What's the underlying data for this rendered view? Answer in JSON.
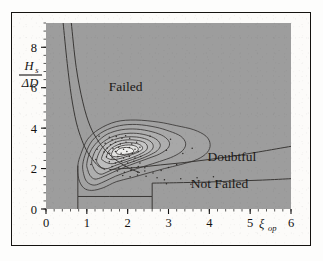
{
  "figure": {
    "kind": "contour-scatter-plot",
    "background_color": "#fcfbf9",
    "plot_fill_color": "#9d9d9d",
    "border_color": "#14120f",
    "line_color": "#3a3836"
  },
  "chart_data": {
    "type": "line",
    "title": "",
    "subtitle": "",
    "xlabel": "ξ_op",
    "ylabel": "H_s / ΔD",
    "xlim": [
      0,
      6
    ],
    "ylim": [
      0,
      9.2
    ],
    "grid": false,
    "legend_position": "none",
    "x_ticks_major": [
      0,
      1,
      2,
      3,
      4,
      5,
      6
    ],
    "x_tick_labels": [
      "0",
      "1",
      "2",
      "3",
      "4",
      "5",
      "6"
    ],
    "y_ticks_major": [
      0,
      2,
      4,
      6,
      8
    ],
    "y_tick_labels": [
      "0",
      "2",
      "4",
      "6",
      "8"
    ],
    "x_minor_step": 0.2,
    "y_minor_step": 0.4,
    "annotations": [
      {
        "text": "Failed",
        "x": 1.95,
        "y": 5.85
      },
      {
        "text": "Doubtful",
        "x": 4.55,
        "y": 2.35
      },
      {
        "text": "Not Failed",
        "x": 4.25,
        "y": 1.05
      }
    ],
    "axis_label_x_symbol": "ξ",
    "axis_label_x_subscript": "op",
    "axis_label_y_numerator": "H",
    "axis_label_y_numerator_sub": "s",
    "axis_label_y_denominator": "ΔD",
    "region_boundaries": [
      {
        "name": "failed-doubtful-boundary",
        "description": "near-horizontal separatrix rising slightly to the right",
        "points": [
          [
            1.55,
            1.95
          ],
          [
            2.2,
            2.05
          ],
          [
            2.8,
            2.18
          ],
          [
            3.4,
            2.3
          ],
          [
            4.0,
            2.45
          ],
          [
            4.6,
            2.62
          ],
          [
            5.2,
            2.82
          ],
          [
            6.0,
            3.1
          ]
        ]
      },
      {
        "name": "doubtful-notfailed-boundary",
        "description": "lower near-horizontal separatrix",
        "points": [
          [
            2.6,
            1.28
          ],
          [
            3.2,
            1.3
          ],
          [
            3.9,
            1.33
          ],
          [
            4.6,
            1.38
          ],
          [
            5.3,
            1.43
          ],
          [
            6.0,
            1.5
          ]
        ]
      },
      {
        "name": "upper-left-curve-outer",
        "description": "steep hyperbolic curve descending from top-left",
        "points": [
          [
            0.42,
            9.2
          ],
          [
            0.52,
            7.2
          ],
          [
            0.62,
            5.6
          ],
          [
            0.74,
            4.3
          ],
          [
            0.88,
            3.4
          ],
          [
            1.02,
            2.8
          ],
          [
            1.18,
            2.35
          ],
          [
            1.3,
            2.1
          ],
          [
            1.45,
            1.95
          ]
        ]
      },
      {
        "name": "upper-left-curve-inner",
        "description": "second steep hyperbolic curve descending from top-left",
        "points": [
          [
            0.62,
            9.2
          ],
          [
            0.74,
            7.0
          ],
          [
            0.9,
            5.3
          ],
          [
            1.08,
            4.1
          ],
          [
            1.3,
            3.3
          ],
          [
            1.55,
            2.7
          ],
          [
            1.8,
            2.3
          ],
          [
            2.05,
            2.0
          ],
          [
            2.3,
            1.8
          ]
        ]
      }
    ],
    "contours": [
      {
        "level": 1,
        "label": "outermost",
        "fill": "#a2a2a2",
        "points": [
          [
            0.78,
            2.15
          ],
          [
            0.86,
            2.75
          ],
          [
            1.02,
            3.45
          ],
          [
            1.3,
            3.95
          ],
          [
            1.72,
            4.32
          ],
          [
            2.2,
            4.4
          ],
          [
            2.75,
            4.3
          ],
          [
            3.2,
            4.12
          ],
          [
            3.62,
            3.92
          ],
          [
            3.92,
            3.6
          ],
          [
            4.02,
            3.2
          ],
          [
            3.95,
            2.8
          ],
          [
            3.7,
            2.45
          ],
          [
            3.3,
            2.2
          ],
          [
            2.9,
            2.0
          ],
          [
            2.5,
            1.78
          ],
          [
            2.1,
            1.55
          ],
          [
            1.72,
            1.35
          ],
          [
            1.4,
            1.05
          ],
          [
            1.12,
            0.92
          ],
          [
            0.92,
            1.05
          ],
          [
            0.8,
            1.5
          ]
        ]
      },
      {
        "level": 2,
        "fill": "#a8a8a8",
        "points": [
          [
            0.9,
            2.2
          ],
          [
            0.98,
            2.8
          ],
          [
            1.14,
            3.4
          ],
          [
            1.42,
            3.85
          ],
          [
            1.8,
            4.12
          ],
          [
            2.22,
            4.18
          ],
          [
            2.68,
            4.05
          ],
          [
            3.02,
            3.85
          ],
          [
            3.3,
            3.6
          ],
          [
            3.42,
            3.25
          ],
          [
            3.35,
            2.9
          ],
          [
            3.12,
            2.6
          ],
          [
            2.78,
            2.35
          ],
          [
            2.42,
            2.12
          ],
          [
            2.05,
            1.88
          ],
          [
            1.7,
            1.62
          ],
          [
            1.42,
            1.35
          ],
          [
            1.18,
            1.18
          ],
          [
            1.0,
            1.35
          ],
          [
            0.92,
            1.75
          ]
        ]
      },
      {
        "level": 3,
        "fill": "#aeaeae",
        "points": [
          [
            1.0,
            2.25
          ],
          [
            1.08,
            2.82
          ],
          [
            1.25,
            3.3
          ],
          [
            1.5,
            3.7
          ],
          [
            1.85,
            3.92
          ],
          [
            2.22,
            3.95
          ],
          [
            2.6,
            3.82
          ],
          [
            2.88,
            3.6
          ],
          [
            3.02,
            3.3
          ],
          [
            2.98,
            3.0
          ],
          [
            2.78,
            2.72
          ],
          [
            2.5,
            2.5
          ],
          [
            2.2,
            2.28
          ],
          [
            1.9,
            2.05
          ],
          [
            1.62,
            1.8
          ],
          [
            1.38,
            1.58
          ],
          [
            1.2,
            1.48
          ],
          [
            1.08,
            1.65
          ],
          [
            1.02,
            1.95
          ]
        ]
      },
      {
        "level": 4,
        "fill": "#b5b5b5",
        "points": [
          [
            1.12,
            2.35
          ],
          [
            1.2,
            2.85
          ],
          [
            1.36,
            3.25
          ],
          [
            1.6,
            3.55
          ],
          [
            1.9,
            3.72
          ],
          [
            2.22,
            3.74
          ],
          [
            2.52,
            3.62
          ],
          [
            2.72,
            3.42
          ],
          [
            2.8,
            3.15
          ],
          [
            2.72,
            2.88
          ],
          [
            2.52,
            2.65
          ],
          [
            2.28,
            2.45
          ],
          [
            2.0,
            2.25
          ],
          [
            1.75,
            2.05
          ],
          [
            1.52,
            1.85
          ],
          [
            1.35,
            1.72
          ],
          [
            1.22,
            1.85
          ],
          [
            1.15,
            2.1
          ]
        ]
      },
      {
        "level": 5,
        "fill": "#bdbdbd",
        "points": [
          [
            1.24,
            2.42
          ],
          [
            1.32,
            2.86
          ],
          [
            1.46,
            3.2
          ],
          [
            1.68,
            3.44
          ],
          [
            1.95,
            3.56
          ],
          [
            2.22,
            3.56
          ],
          [
            2.46,
            3.45
          ],
          [
            2.6,
            3.26
          ],
          [
            2.62,
            3.02
          ],
          [
            2.52,
            2.8
          ],
          [
            2.34,
            2.62
          ],
          [
            2.12,
            2.45
          ],
          [
            1.9,
            2.3
          ],
          [
            1.68,
            2.14
          ],
          [
            1.5,
            2.0
          ],
          [
            1.36,
            2.05
          ],
          [
            1.28,
            2.22
          ]
        ]
      },
      {
        "level": 6,
        "fill": "#c6c6c6",
        "points": [
          [
            1.36,
            2.5
          ],
          [
            1.44,
            2.88
          ],
          [
            1.58,
            3.15
          ],
          [
            1.76,
            3.34
          ],
          [
            1.99,
            3.42
          ],
          [
            2.22,
            3.4
          ],
          [
            2.4,
            3.3
          ],
          [
            2.48,
            3.12
          ],
          [
            2.46,
            2.92
          ],
          [
            2.34,
            2.75
          ],
          [
            2.18,
            2.6
          ],
          [
            1.99,
            2.46
          ],
          [
            1.8,
            2.34
          ],
          [
            1.62,
            2.24
          ],
          [
            1.48,
            2.3
          ],
          [
            1.4,
            2.4
          ]
        ]
      },
      {
        "level": 7,
        "fill": "#d2d2d2",
        "points": [
          [
            1.48,
            2.58
          ],
          [
            1.55,
            2.9
          ],
          [
            1.68,
            3.1
          ],
          [
            1.85,
            3.24
          ],
          [
            2.04,
            3.28
          ],
          [
            2.22,
            3.24
          ],
          [
            2.34,
            3.12
          ],
          [
            2.36,
            2.96
          ],
          [
            2.26,
            2.82
          ],
          [
            2.12,
            2.7
          ],
          [
            1.95,
            2.58
          ],
          [
            1.78,
            2.48
          ],
          [
            1.62,
            2.44
          ],
          [
            1.52,
            2.5
          ]
        ]
      },
      {
        "level": 8,
        "fill": "#e2e2e0",
        "points": [
          [
            1.6,
            2.68
          ],
          [
            1.66,
            2.94
          ],
          [
            1.78,
            3.08
          ],
          [
            1.94,
            3.16
          ],
          [
            2.1,
            3.16
          ],
          [
            2.22,
            3.08
          ],
          [
            2.26,
            2.94
          ],
          [
            2.2,
            2.82
          ],
          [
            2.06,
            2.72
          ],
          [
            1.9,
            2.64
          ],
          [
            1.75,
            2.58
          ],
          [
            1.65,
            2.6
          ]
        ]
      },
      {
        "level": 9,
        "label": "innermost-core",
        "fill": "#eeeeec",
        "points": [
          [
            1.72,
            2.78
          ],
          [
            1.78,
            2.96
          ],
          [
            1.9,
            3.04
          ],
          [
            2.04,
            3.03
          ],
          [
            2.13,
            2.94
          ],
          [
            2.14,
            2.82
          ],
          [
            2.05,
            2.74
          ],
          [
            1.92,
            2.7
          ],
          [
            1.8,
            2.7
          ]
        ]
      }
    ],
    "step_lines": [
      {
        "name": "left-step",
        "points": [
          [
            0.78,
            2.15
          ],
          [
            0.78,
            0.62
          ],
          [
            0.78,
            0.0
          ]
        ]
      },
      {
        "name": "right-step",
        "points": [
          [
            2.6,
            1.28
          ],
          [
            2.6,
            0.62
          ],
          [
            2.6,
            0.0
          ]
        ]
      },
      {
        "name": "lower-shelf",
        "points": [
          [
            0.78,
            0.62
          ],
          [
            1.55,
            0.62
          ],
          [
            2.6,
            0.62
          ]
        ]
      }
    ],
    "scatter_points": [
      [
        1.55,
        3.55
      ],
      [
        1.62,
        3.42
      ],
      [
        1.72,
        3.58
      ],
      [
        1.86,
        3.5
      ],
      [
        1.95,
        3.62
      ],
      [
        2.05,
        3.5
      ],
      [
        1.45,
        3.25
      ],
      [
        1.58,
        3.18
      ],
      [
        1.7,
        3.3
      ],
      [
        1.82,
        3.22
      ],
      [
        1.96,
        3.3
      ],
      [
        2.1,
        3.22
      ],
      [
        2.22,
        3.3
      ],
      [
        1.5,
        3.02
      ],
      [
        1.64,
        2.98
      ],
      [
        1.78,
        3.06
      ],
      [
        1.9,
        2.96
      ],
      [
        2.04,
        3.04
      ],
      [
        2.18,
        2.96
      ],
      [
        2.3,
        3.05
      ],
      [
        1.42,
        2.82
      ],
      [
        1.56,
        2.76
      ],
      [
        1.7,
        2.84
      ],
      [
        1.84,
        2.76
      ],
      [
        1.98,
        2.84
      ],
      [
        2.12,
        2.76
      ],
      [
        2.26,
        2.85
      ],
      [
        1.48,
        2.58
      ],
      [
        1.62,
        2.52
      ],
      [
        1.76,
        2.6
      ],
      [
        1.9,
        2.52
      ],
      [
        2.04,
        2.6
      ],
      [
        2.18,
        2.52
      ],
      [
        2.32,
        2.6
      ],
      [
        1.55,
        2.34
      ],
      [
        1.7,
        2.28
      ],
      [
        1.85,
        2.36
      ],
      [
        2.0,
        2.28
      ],
      [
        2.15,
        2.36
      ],
      [
        2.3,
        2.28
      ],
      [
        1.62,
        2.1
      ],
      [
        1.78,
        2.04
      ],
      [
        1.94,
        2.12
      ],
      [
        2.1,
        2.04
      ],
      [
        2.26,
        2.1
      ],
      [
        2.42,
        2.04
      ],
      [
        1.75,
        1.88
      ],
      [
        1.92,
        1.82
      ],
      [
        2.08,
        1.9
      ],
      [
        2.25,
        1.82
      ],
      [
        2.42,
        1.88
      ],
      [
        1.88,
        1.66
      ],
      [
        2.06,
        1.6
      ],
      [
        2.24,
        1.68
      ],
      [
        2.45,
        1.62
      ],
      [
        2.62,
        1.78
      ],
      [
        2.82,
        1.9
      ],
      [
        3.0,
        2.05
      ],
      [
        3.2,
        2.2
      ],
      [
        2.72,
        1.55
      ],
      [
        2.95,
        2.9
      ],
      [
        3.35,
        2.75
      ],
      [
        3.58,
        3.0
      ],
      [
        3.05,
        3.45
      ],
      [
        2.55,
        3.6
      ],
      [
        1.25,
        2.95
      ],
      [
        1.22,
        2.45
      ],
      [
        1.3,
        3.6
      ],
      [
        1.1,
        2.2
      ],
      [
        2.9,
        1.45
      ],
      [
        3.7,
        1.55
      ],
      [
        3.3,
        1.5
      ],
      [
        4.1,
        1.6
      ],
      [
        2.95,
        1.25
      ],
      [
        3.55,
        1.22
      ]
    ]
  }
}
